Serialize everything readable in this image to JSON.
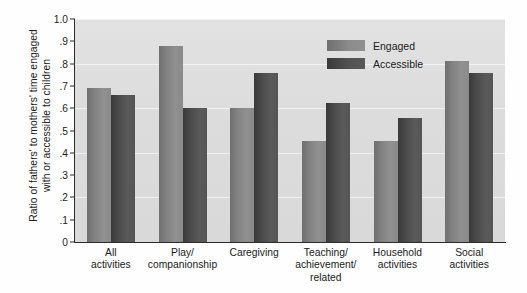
{
  "chart_data": {
    "type": "bar",
    "title": "",
    "xlabel": "",
    "ylabel_line1": "Ratio of fathers' to mothers' time engaged",
    "ylabel_line2": "with or accessible to children",
    "categories": [
      "All\nactivities",
      "Play/\ncompanionship",
      "Caregiving",
      "Teaching/\nachievement/\nrelated",
      "Household\nactivities",
      "Social\nactivities"
    ],
    "series": [
      {
        "name": "Engaged",
        "color": "#8a8a8a",
        "values": [
          0.69,
          0.88,
          0.6,
          0.455,
          0.455,
          0.81
        ]
      },
      {
        "name": "Accessible",
        "color": "#4c4c4c",
        "values": [
          0.66,
          0.6,
          0.76,
          0.625,
          0.555,
          0.76
        ]
      }
    ],
    "ylim": [
      0,
      1.0
    ],
    "ytick_values": [
      0,
      0.1,
      0.2,
      0.3,
      0.4,
      0.5,
      0.6,
      0.7,
      0.8,
      0.9,
      1.0
    ],
    "ytick_labels": [
      "0",
      ".1",
      ".2",
      ".3",
      ".4",
      ".5",
      ".6",
      ".7",
      ".8",
      ".9",
      "1.0"
    ],
    "grid": true,
    "gridline_values": [
      0.2,
      0.4,
      0.6,
      0.8,
      1.0
    ],
    "legend_position": "top-right",
    "plot_background": "#dcdcdc",
    "gridline_color": "#f2f2f2",
    "axis_color": "#2b2b2b"
  }
}
